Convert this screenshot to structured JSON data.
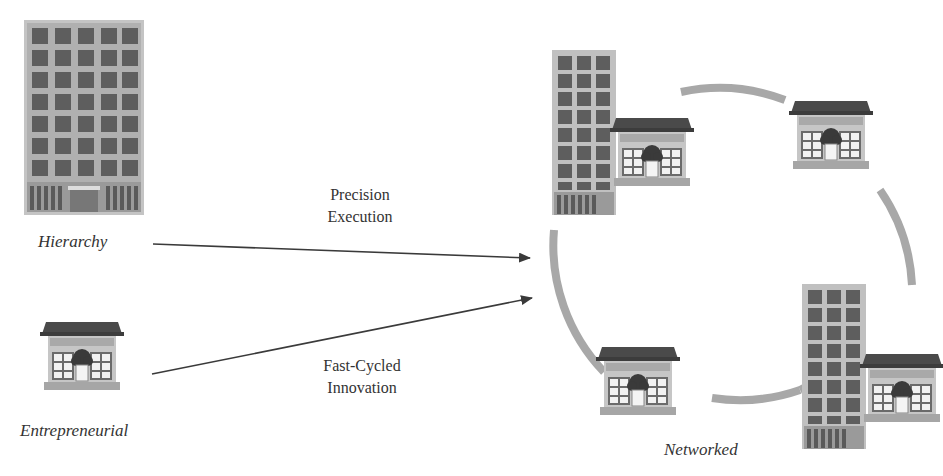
{
  "diagram": {
    "title_fragment": "",
    "nodes": [
      {
        "id": "hierarchy",
        "label": "Hierarchy",
        "icon": "office-tower-icon"
      },
      {
        "id": "entrepreneurial",
        "label": "Entrepreneurial",
        "icon": "small-shop-icon"
      },
      {
        "id": "networked",
        "label": "Networked",
        "icon": "network-cluster-icon"
      }
    ],
    "edges": [
      {
        "from": "hierarchy",
        "to": "networked",
        "label_line1": "Precision",
        "label_line2": "Execution"
      },
      {
        "from": "entrepreneurial",
        "to": "networked",
        "label_line1": "Fast-Cycled",
        "label_line2": "Innovation"
      }
    ],
    "network_members": [
      "tower-with-shop",
      "shop",
      "tower-with-shop",
      "shop"
    ],
    "colors": {
      "building_body": "#b9b9b9",
      "window_dark": "#5c5c5c",
      "roof": "#4a4a4a",
      "ring": "#a8a8a8",
      "arrow": "#3a3a3a",
      "text": "#333333"
    }
  }
}
